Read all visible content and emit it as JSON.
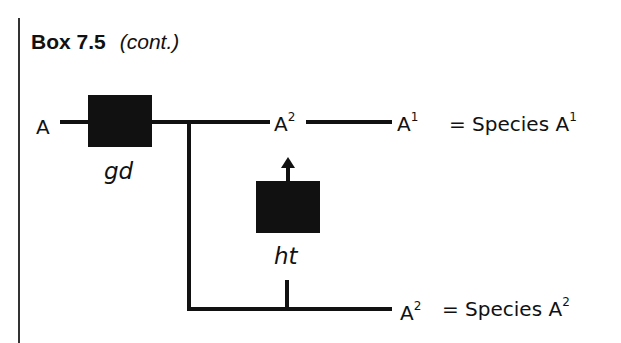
{
  "header": {
    "box_number": "Box 7.5",
    "continuation": "(cont.)"
  },
  "diagram": {
    "start_label": "A",
    "gene_duplication": {
      "label": "gd"
    },
    "horizontal_transfer": {
      "label": "ht"
    },
    "branch_top": {
      "intermediate_base": "A",
      "intermediate_sup": "2",
      "end_base": "A",
      "end_sup": "1",
      "species_text": "= Species A",
      "species_sup": "1"
    },
    "branch_bottom": {
      "end_base": "A",
      "end_sup": "2",
      "species_text": "= Species A",
      "species_sup": "2"
    }
  }
}
